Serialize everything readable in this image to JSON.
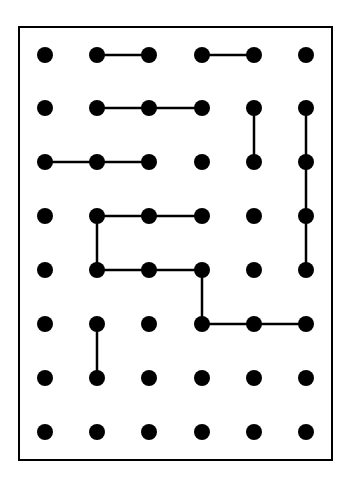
{
  "grid": {
    "columns": 6,
    "rows": 8,
    "col_x": [
      45,
      97,
      149,
      202,
      254,
      306
    ],
    "row_y": [
      55,
      108,
      162,
      216,
      270,
      324,
      378,
      432
    ],
    "dot_radius": 8,
    "dot_color": "#000000",
    "line_color": "#000000",
    "line_width": 2.5
  },
  "frame": {
    "x": 19,
    "y": 27,
    "width": 313,
    "height": 433,
    "stroke": "#000000",
    "stroke_width": 2
  },
  "segments": [
    {
      "from": [
        1,
        0
      ],
      "to": [
        2,
        0
      ]
    },
    {
      "from": [
        3,
        0
      ],
      "to": [
        4,
        0
      ]
    },
    {
      "from": [
        1,
        1
      ],
      "to": [
        3,
        1
      ]
    },
    {
      "from": [
        4,
        1
      ],
      "to": [
        4,
        2
      ]
    },
    {
      "from": [
        5,
        1
      ],
      "to": [
        5,
        4
      ]
    },
    {
      "from": [
        0,
        2
      ],
      "to": [
        2,
        2
      ]
    },
    {
      "from": [
        1,
        3
      ],
      "to": [
        3,
        3
      ]
    },
    {
      "from": [
        1,
        3
      ],
      "to": [
        1,
        4
      ]
    },
    {
      "from": [
        1,
        4
      ],
      "to": [
        3,
        4
      ]
    },
    {
      "from": [
        3,
        4
      ],
      "to": [
        3,
        5
      ]
    },
    {
      "from": [
        3,
        5
      ],
      "to": [
        5,
        5
      ]
    },
    {
      "from": [
        1,
        5
      ],
      "to": [
        1,
        6
      ]
    }
  ]
}
